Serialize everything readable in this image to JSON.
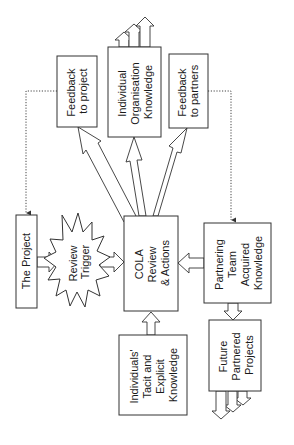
{
  "diagram": {
    "nodes": {
      "feedback_project": {
        "lines": [
          "Feedback",
          "to project"
        ]
      },
      "individual_org_knowledge": {
        "lines": [
          "Individual",
          "Organisation",
          "Knowledge"
        ]
      },
      "feedback_partners": {
        "lines": [
          "Feedback",
          "to partners"
        ]
      },
      "the_project": {
        "lines": [
          "The Project"
        ]
      },
      "review_trigger": {
        "lines": [
          "Review",
          "Trigger"
        ]
      },
      "cola": {
        "lines": [
          "COLA",
          "Review",
          "& Actions"
        ]
      },
      "partnering_team": {
        "lines": [
          "Partnering",
          "Team",
          "Acquired",
          "Knowledge"
        ]
      },
      "individuals_knowledge": {
        "lines": [
          "Individuals'",
          "Tacit and",
          "Explicit",
          "Knowledge"
        ]
      },
      "future_projects": {
        "lines": [
          "Future",
          "Partnered",
          "Projects"
        ]
      }
    },
    "edges": [
      {
        "from": "the_project",
        "to": "review_trigger",
        "style": "block-arrow"
      },
      {
        "from": "review_trigger",
        "to": "cola",
        "style": "block-arrow"
      },
      {
        "from": "partnering_team",
        "to": "cola",
        "style": "block-arrow"
      },
      {
        "from": "individuals_knowledge",
        "to": "cola",
        "style": "block-arrow"
      },
      {
        "from": "cola",
        "to": "feedback_project",
        "style": "block-arrow"
      },
      {
        "from": "cola",
        "to": "individual_org_knowledge",
        "style": "block-arrow"
      },
      {
        "from": "cola",
        "to": "feedback_partners",
        "style": "block-arrow"
      },
      {
        "from": "partnering_team",
        "to": "future_projects",
        "style": "block-arrow"
      },
      {
        "from": "individual_org_knowledge",
        "to": "outward",
        "style": "stacked-block-arrows"
      },
      {
        "from": "future_projects",
        "to": "outward",
        "style": "stacked-block-arrows"
      },
      {
        "from": "feedback_project",
        "to": "the_project",
        "style": "dotted"
      },
      {
        "from": "feedback_partners",
        "to": "partnering_team",
        "style": "dotted"
      }
    ]
  }
}
